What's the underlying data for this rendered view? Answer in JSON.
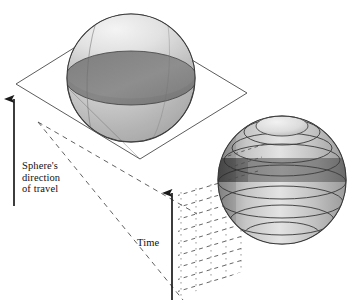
{
  "figure": {
    "caption_labels": {
      "sphere_direction": "Sphere's\ndirection\nof travel",
      "time": "Time"
    },
    "colors": {
      "outline": "#3a3a3a",
      "ink": "#111111",
      "plane_stroke": "#444444",
      "sphere_light": "#e8e8e8",
      "sphere_mid": "#c9c9c9",
      "sphere_dark": "#8d8d8d",
      "slice_dark": "#6f6f6f",
      "dashed": "#555555",
      "background": "#ffffff"
    },
    "objects": {
      "upper_sphere": {
        "name": "sphere-intersecting-plane",
        "center_x": 131,
        "center_y": 78,
        "radius": 64,
        "cross_section": "dark ellipse where plane cuts sphere"
      },
      "plane": {
        "name": "slicing-plane",
        "corners": [
          [
            16,
            84
          ],
          [
            122,
            18
          ],
          [
            247,
            93
          ],
          [
            140,
            159
          ]
        ]
      },
      "lower_sphere": {
        "name": "sliced-sphere-stack",
        "center_x": 282,
        "center_y": 180,
        "radius": 64,
        "band_count": 9,
        "highlighted_band_index": 4
      },
      "time_grid": {
        "name": "dashed-time-plane",
        "corners": [
          [
            178,
            188
          ],
          [
            243,
            172
          ],
          [
            243,
            272
          ],
          [
            178,
            300
          ]
        ],
        "rows": 9,
        "cols": 5
      },
      "arrows": [
        {
          "name": "sphere-direction-arrow",
          "x": 14,
          "y_top": 96,
          "y_bottom": 206,
          "direction": "up"
        },
        {
          "name": "time-arrow",
          "x": 172,
          "y_top": 190,
          "y_bottom": 300,
          "direction": "up"
        }
      ],
      "projection_lines": {
        "name": "dashed-projection-lines",
        "from": [
          38,
          122
        ],
        "to": [
          [
            196,
            213
          ],
          [
            196,
            300
          ]
        ]
      }
    }
  }
}
